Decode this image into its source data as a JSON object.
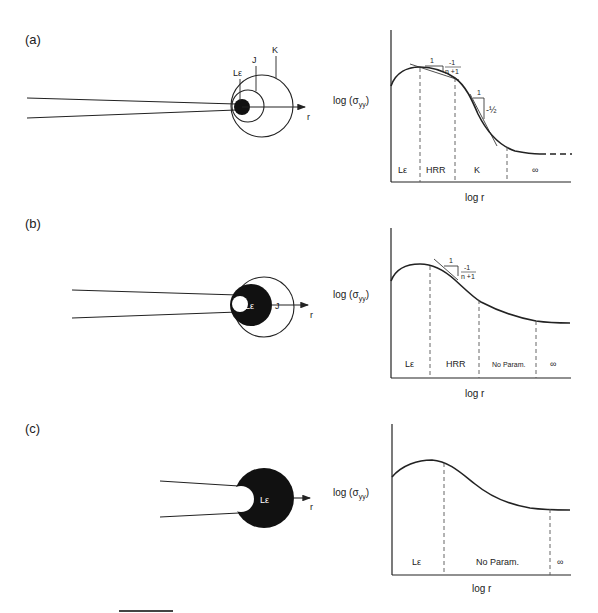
{
  "panels": [
    {
      "id": "a",
      "label": "(a)",
      "crack": {
        "zone_labels": [
          "Lε",
          "J",
          "K"
        ],
        "axis_label": "r"
      },
      "chart": {
        "ylabel": "log (σyy)",
        "ylabel_main": "log (σ",
        "ylabel_sub": "yy",
        "ylabel_close": ")",
        "xlabel": "log r",
        "regions": [
          "Lε",
          "HRR",
          "K",
          "∞"
        ],
        "slopes": [
          {
            "run": "1",
            "rise_num": "-1",
            "rise_den": "n +1"
          },
          {
            "run": "1",
            "rise": "-½"
          }
        ]
      }
    },
    {
      "id": "b",
      "label": "(b)",
      "crack": {
        "zone_labels": [
          "Lε",
          "J"
        ],
        "axis_label": "r"
      },
      "chart": {
        "ylabel": "log (σyy)",
        "ylabel_main": "log (σ",
        "ylabel_sub": "yy",
        "ylabel_close": ")",
        "xlabel": "log r",
        "regions": [
          "Lε",
          "HRR",
          "No Param.",
          "∞"
        ],
        "slopes": [
          {
            "run": "1",
            "rise_num": "-1",
            "rise_den": "n +1"
          }
        ]
      }
    },
    {
      "id": "c",
      "label": "(c)",
      "crack": {
        "zone_labels": [
          "Lε"
        ],
        "axis_label": "r"
      },
      "chart": {
        "ylabel": "log (σyy)",
        "ylabel_main": "log (σ",
        "ylabel_sub": "yy",
        "ylabel_close": ")",
        "xlabel": "log r",
        "regions": [
          "Lε",
          "No Param.",
          "∞"
        ],
        "slopes": []
      }
    }
  ],
  "colors": {
    "ink": "#222222",
    "dash": "#555555",
    "background": "#ffffff"
  }
}
